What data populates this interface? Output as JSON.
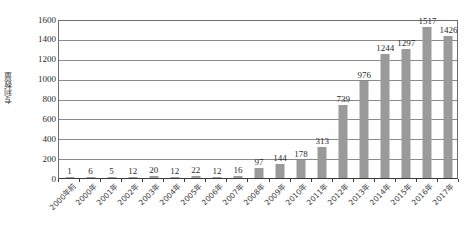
{
  "chart_data": {
    "type": "bar",
    "title": "",
    "subtitle": "",
    "xlabel": "",
    "ylabel": "专利数量",
    "ylim": [
      0,
      1600
    ],
    "ytick_step": 200,
    "grid": true,
    "legend": false,
    "bar_color": "#9a9a9a",
    "axis_color": "#3a3a3a",
    "gridline_color": "#8a8a8a",
    "categories": [
      "2000年前",
      "2000年",
      "2001年",
      "2002年",
      "2003年",
      "2004年",
      "2005年",
      "2006年",
      "2007年",
      "2008年",
      "2009年",
      "2010年",
      "2011年",
      "2012年",
      "2013年",
      "2014年",
      "2015年",
      "2016年",
      "2017年"
    ],
    "values": [
      1,
      6,
      5,
      12,
      20,
      12,
      22,
      12,
      16,
      97,
      144,
      178,
      313,
      739,
      976,
      1244,
      1297,
      1517,
      1426
    ],
    "value_labels": [
      "1",
      "6",
      "5",
      "12",
      "20",
      "12",
      "22",
      "12",
      "16",
      "97",
      "144",
      "178",
      "313",
      "739",
      "976",
      "1244",
      "1297",
      "1517",
      "1426"
    ],
    "ytick_labels": [
      "0",
      "200",
      "400",
      "600",
      "800",
      "1000",
      "1200",
      "1400",
      "1600"
    ],
    "ytick_values": [
      0,
      200,
      400,
      600,
      800,
      1000,
      1200,
      1400,
      1600
    ]
  }
}
